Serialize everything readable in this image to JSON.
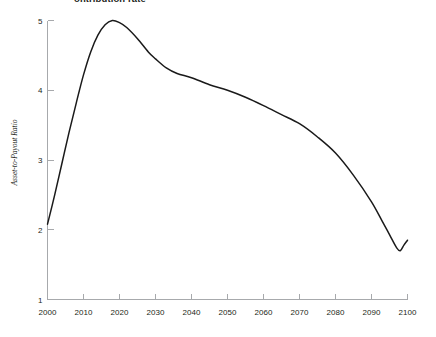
{
  "chart_data": {
    "type": "line",
    "title": "ontribution rate",
    "xlabel": "",
    "ylabel": "Asset-to-Payout Ratio",
    "xlim": [
      2000,
      2100
    ],
    "ylim": [
      1,
      5
    ],
    "grid": false,
    "legend": "none",
    "x_ticks": [
      2000,
      2010,
      2020,
      2030,
      2040,
      2050,
      2060,
      2070,
      2080,
      2090,
      2100
    ],
    "y_ticks": [
      1,
      2,
      3,
      4,
      5
    ],
    "series": [
      {
        "name": "Asset-to-Payout Ratio",
        "color": "#1a1a1a",
        "x": [
          2000,
          2002,
          2004,
          2006,
          2008,
          2010,
          2012,
          2014,
          2016,
          2018,
          2020,
          2022,
          2025,
          2028,
          2030,
          2033,
          2036,
          2040,
          2045,
          2050,
          2055,
          2060,
          2065,
          2070,
          2075,
          2080,
          2085,
          2090,
          2093,
          2095,
          2097,
          2098,
          2099,
          2100
        ],
        "values": [
          2.08,
          2.5,
          2.95,
          3.4,
          3.82,
          4.22,
          4.55,
          4.79,
          4.94,
          5.0,
          4.97,
          4.9,
          4.74,
          4.55,
          4.45,
          4.32,
          4.24,
          4.18,
          4.08,
          4.0,
          3.9,
          3.78,
          3.65,
          3.52,
          3.33,
          3.1,
          2.78,
          2.4,
          2.12,
          1.93,
          1.74,
          1.7,
          1.78,
          1.85
        ]
      }
    ],
    "annotations": []
  },
  "axes": {
    "y_axis_label": "Asset-to-Payout Ratio",
    "y_tick_labels": [
      "1",
      "2",
      "3",
      "4",
      "5"
    ],
    "x_tick_labels": [
      "2000",
      "2010",
      "2020",
      "2030",
      "2040",
      "2050",
      "2060",
      "2070",
      "2080",
      "2090",
      "2100"
    ]
  },
  "colors": {
    "curve": "#1a1a1a",
    "axis": "#a7a9ac",
    "text": "#231f20",
    "background": "#ffffff"
  }
}
